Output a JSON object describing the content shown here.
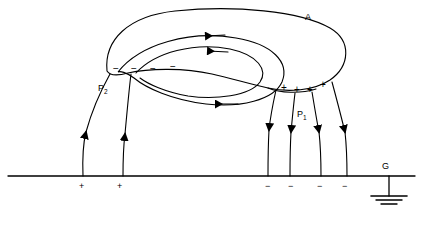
{
  "figure": {
    "title_label": "A",
    "ground_label": "G",
    "point_labels": [
      {
        "id": "P2",
        "text": "P",
        "sub": "2",
        "x": 98,
        "y": 84
      },
      {
        "id": "P1",
        "text": "P",
        "sub": "1",
        "x": 297,
        "y": 110
      }
    ],
    "cloud_label": {
      "text": "A",
      "x": 305,
      "y": 13
    },
    "ground_symbol_label": {
      "text": "G",
      "x": 382,
      "y": 162
    },
    "cloud_negative_signs": [
      {
        "sym": "−",
        "x": 113,
        "y": 64
      },
      {
        "sym": "−",
        "x": 131,
        "y": 64
      },
      {
        "sym": "−",
        "x": 150,
        "y": 64
      },
      {
        "sym": "−",
        "x": 170,
        "y": 62
      }
    ],
    "cloud_positive_signs": [
      {
        "sym": "+",
        "x": 281,
        "y": 83
      },
      {
        "sym": "+",
        "x": 294,
        "y": 85
      },
      {
        "sym": "+",
        "x": 307,
        "y": 85
      },
      {
        "sym": "+",
        "x": 320,
        "y": 80
      }
    ],
    "ground_positive_signs": [
      {
        "sym": "+",
        "x": 79,
        "y": 183
      },
      {
        "sym": "+",
        "x": 117,
        "y": 183
      }
    ],
    "ground_negative_signs": [
      {
        "sym": "−",
        "x": 266,
        "y": 183
      },
      {
        "sym": "−",
        "x": 289,
        "y": 183
      },
      {
        "sym": "−",
        "x": 318,
        "y": 183
      },
      {
        "sym": "−",
        "x": 343,
        "y": 183
      }
    ],
    "colors": {
      "stroke": "#000000",
      "background": "#ffffff"
    }
  },
  "geometry": {
    "ground_line": {
      "x1": 8,
      "y1": 176,
      "x2": 415,
      "y2": 176
    },
    "ground_symbol": {
      "stem_x": 389,
      "stem_top": 176,
      "stem_bottom": 196,
      "bars": [
        [
          371,
          407,
          196
        ],
        [
          376,
          402,
          200
        ],
        [
          381,
          397,
          204
        ]
      ]
    }
  }
}
